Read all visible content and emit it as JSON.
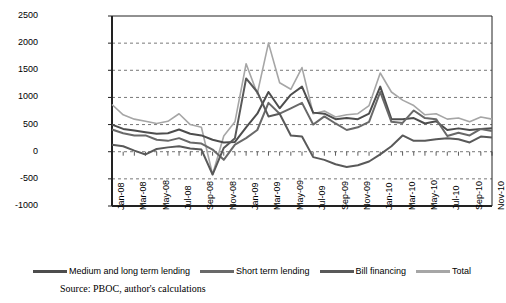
{
  "source_note": "Source: PBOC, author's calculations",
  "legend": {
    "position": "bottom",
    "items": [
      {
        "label": "Medium and long term lending",
        "color": "#4d4d4d"
      },
      {
        "label": "Short term lending",
        "color": "#696969"
      },
      {
        "label": "Bill financing",
        "color": "#595959"
      },
      {
        "label": "Total",
        "color": "#a6a6a6"
      }
    ]
  },
  "chart_data": {
    "type": "line",
    "title": "",
    "xlabel": "",
    "ylabel": "",
    "ylim": [
      -1000,
      2500
    ],
    "ytick_step": 500,
    "yticks": [
      -1000,
      -500,
      0,
      500,
      1000,
      1500,
      2000,
      2500
    ],
    "grid": true,
    "grid_style": "dashed-horizontal",
    "x": [
      "Jan-08",
      "Feb-08",
      "Mar-08",
      "Apr-08",
      "May-08",
      "Jun-08",
      "Jul-08",
      "Aug-08",
      "Sep-08",
      "Oct-08",
      "Nov-08",
      "Dec-08",
      "Jan-09",
      "Feb-09",
      "Mar-09",
      "Apr-09",
      "May-09",
      "Jun-09",
      "Jul-09",
      "Aug-09",
      "Sep-09",
      "Oct-09",
      "Nov-09",
      "Dec-09",
      "Jan-10",
      "Feb-10",
      "Mar-10",
      "Apr-10",
      "May-10",
      "Jun-10",
      "Jul-10",
      "Aug-10",
      "Sep-10",
      "Oct-10",
      "Nov-10"
    ],
    "xtick_labels": [
      "Jan-08",
      "Mar-08",
      "May-08",
      "Jul-08",
      "Sep-08",
      "Nov-08",
      "Jan-09",
      "Mar-09",
      "May-09",
      "Jul-09",
      "Sep-09",
      "Nov-09",
      "Jan-10",
      "Mar-10",
      "May-10",
      "Jul-10",
      "Sep-10",
      "Nov-10"
    ],
    "xtick_indices": [
      0,
      2,
      4,
      6,
      8,
      10,
      12,
      14,
      16,
      18,
      20,
      22,
      24,
      26,
      28,
      30,
      32,
      34
    ],
    "series": [
      {
        "name": "Medium and long term lending",
        "color": "#4d4d4d",
        "values": [
          500,
          420,
          390,
          360,
          330,
          340,
          410,
          330,
          300,
          220,
          170,
          180,
          450,
          700,
          1100,
          800,
          1050,
          1200,
          720,
          700,
          600,
          620,
          600,
          700,
          1200,
          600,
          600,
          620,
          520,
          560,
          400,
          430,
          400,
          420,
          430
        ]
      },
      {
        "name": "Short term lending",
        "color": "#696969",
        "values": [
          410,
          340,
          300,
          300,
          220,
          200,
          250,
          170,
          150,
          40,
          -150,
          130,
          250,
          400,
          900,
          700,
          800,
          900,
          500,
          650,
          520,
          400,
          450,
          550,
          1100,
          550,
          530,
          760,
          620,
          600,
          290,
          350,
          300,
          420,
          380
        ]
      },
      {
        "name": "Bill financing",
        "color": "#595959",
        "values": [
          130,
          100,
          20,
          -50,
          50,
          80,
          100,
          60,
          40,
          -420,
          70,
          250,
          1350,
          1100,
          650,
          700,
          300,
          280,
          -100,
          -150,
          -230,
          -280,
          -250,
          -180,
          -50,
          100,
          300,
          200,
          200,
          230,
          250,
          230,
          170,
          280,
          260
        ]
      },
      {
        "name": "Total",
        "color": "#a6a6a6",
        "values": [
          870,
          680,
          600,
          560,
          520,
          560,
          700,
          500,
          450,
          -420,
          290,
          550,
          1620,
          1070,
          2000,
          1270,
          1150,
          1550,
          700,
          750,
          640,
          680,
          700,
          850,
          1450,
          1100,
          950,
          850,
          680,
          700,
          600,
          620,
          550,
          640,
          600
        ]
      }
    ]
  }
}
